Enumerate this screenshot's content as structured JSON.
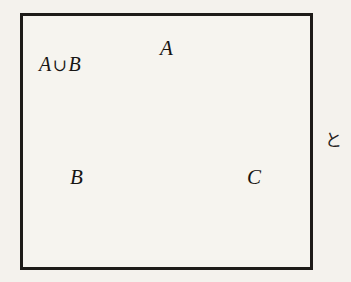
{
  "figure": {
    "box": {
      "name": "universal-set-rectangle"
    },
    "background_color": "#f6f4ef",
    "stroke_color": "#1d1b18",
    "shade_color": "#d2d0cb",
    "circles": [
      {
        "id": "A",
        "label": "A",
        "cx": 167,
        "cy": 113,
        "r": 67
      },
      {
        "id": "B",
        "label": "B",
        "cx": 135,
        "cy": 172,
        "r": 67
      },
      {
        "id": "C",
        "label": "C",
        "cx": 199,
        "cy": 172,
        "r": 67
      }
    ],
    "shaded_region": "A union B",
    "callout": {
      "label_a": "A",
      "operator": "∪",
      "label_b": "B",
      "full_text": "A ∪ B"
    }
  },
  "side_text": {
    "character": "と"
  }
}
